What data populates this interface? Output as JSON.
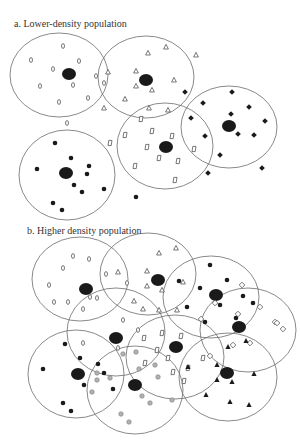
{
  "colors": {
    "circle_stroke": "#6b6b6b",
    "center": "#1a1a1a",
    "filled_marker": "#1a1a1a",
    "grey_marker": "#b0b0b0",
    "outline_marker": "#555555",
    "text": "#333333"
  },
  "panels": [
    {
      "id": "a",
      "label": "a. Lower-density population",
      "circles": [
        {
          "cx": 59,
          "cy": 75,
          "rx": 49,
          "ry": 42
        },
        {
          "cx": 146,
          "cy": 77,
          "rx": 48,
          "ry": 41
        },
        {
          "cx": 229,
          "cy": 127,
          "rx": 48,
          "ry": 41
        },
        {
          "cx": 165,
          "cy": 146,
          "rx": 48,
          "ry": 43
        },
        {
          "cx": 67,
          "cy": 175,
          "rx": 48,
          "ry": 45
        }
      ],
      "centers": [
        {
          "x": 69,
          "y": 74,
          "rx": 7,
          "ry": 6
        },
        {
          "x": 146,
          "y": 80,
          "rx": 7,
          "ry": 6
        },
        {
          "x": 229,
          "y": 126,
          "rx": 7,
          "ry": 6
        },
        {
          "x": 166,
          "y": 147,
          "rx": 7,
          "ry": 6
        },
        {
          "x": 66,
          "y": 173,
          "rx": 7,
          "ry": 6
        }
      ],
      "markers": [
        {
          "shape": "oval",
          "x": 63,
          "y": 46
        },
        {
          "shape": "oval",
          "x": 31,
          "y": 60
        },
        {
          "shape": "oval",
          "x": 79,
          "y": 61
        },
        {
          "shape": "oval",
          "x": 53,
          "y": 69
        },
        {
          "shape": "oval",
          "x": 96,
          "y": 76
        },
        {
          "shape": "oval",
          "x": 40,
          "y": 86
        },
        {
          "shape": "oval",
          "x": 73,
          "y": 85
        },
        {
          "shape": "oval",
          "x": 104,
          "y": 83
        },
        {
          "shape": "oval",
          "x": 88,
          "y": 98
        },
        {
          "shape": "oval",
          "x": 59,
          "y": 102
        },
        {
          "shape": "oval",
          "x": 67,
          "y": 123
        },
        {
          "shape": "triangle",
          "x": 148,
          "y": 53
        },
        {
          "shape": "triangle",
          "x": 166,
          "y": 47
        },
        {
          "shape": "triangle",
          "x": 196,
          "y": 55
        },
        {
          "shape": "triangle",
          "x": 108,
          "y": 72
        },
        {
          "shape": "triangle",
          "x": 136,
          "y": 71
        },
        {
          "shape": "triangle",
          "x": 174,
          "y": 80
        },
        {
          "shape": "triangle",
          "x": 136,
          "y": 86
        },
        {
          "shape": "triangle",
          "x": 152,
          "y": 90
        },
        {
          "shape": "triangle",
          "x": 125,
          "y": 99
        },
        {
          "shape": "triangle",
          "x": 104,
          "y": 108
        },
        {
          "shape": "triangle",
          "x": 149,
          "y": 108
        },
        {
          "shape": "triangle",
          "x": 168,
          "y": 110
        },
        {
          "shape": "diamond",
          "x": 185,
          "y": 92
        },
        {
          "shape": "diamond",
          "x": 232,
          "y": 92
        },
        {
          "shape": "diamond",
          "x": 203,
          "y": 103
        },
        {
          "shape": "diamond",
          "x": 249,
          "y": 107
        },
        {
          "shape": "diamond",
          "x": 231,
          "y": 114
        },
        {
          "shape": "diamond",
          "x": 191,
          "y": 118
        },
        {
          "shape": "diamond",
          "x": 265,
          "y": 121
        },
        {
          "shape": "diamond",
          "x": 205,
          "y": 136
        },
        {
          "shape": "diamond",
          "x": 238,
          "y": 134
        },
        {
          "shape": "diamond",
          "x": 254,
          "y": 135
        },
        {
          "shape": "diamond",
          "x": 220,
          "y": 155
        },
        {
          "shape": "diamond",
          "x": 208,
          "y": 173
        },
        {
          "shape": "diamond",
          "x": 262,
          "y": 168
        },
        {
          "shape": "rect",
          "x": 141,
          "y": 119
        },
        {
          "shape": "rect",
          "x": 110,
          "y": 143
        },
        {
          "shape": "rect",
          "x": 125,
          "y": 135
        },
        {
          "shape": "rect",
          "x": 152,
          "y": 131
        },
        {
          "shape": "rect",
          "x": 172,
          "y": 136
        },
        {
          "shape": "rect",
          "x": 147,
          "y": 147
        },
        {
          "shape": "rect",
          "x": 194,
          "y": 149
        },
        {
          "shape": "rect",
          "x": 159,
          "y": 158
        },
        {
          "shape": "rect",
          "x": 178,
          "y": 161
        },
        {
          "shape": "rect",
          "x": 135,
          "y": 166
        },
        {
          "shape": "rect",
          "x": 175,
          "y": 180
        },
        {
          "shape": "dot",
          "x": 55,
          "y": 143
        },
        {
          "shape": "dot",
          "x": 37,
          "y": 169
        },
        {
          "shape": "dot",
          "x": 71,
          "y": 158
        },
        {
          "shape": "dot",
          "x": 89,
          "y": 166
        },
        {
          "shape": "dot",
          "x": 87,
          "y": 174
        },
        {
          "shape": "dot",
          "x": 74,
          "y": 185
        },
        {
          "shape": "dot",
          "x": 82,
          "y": 192
        },
        {
          "shape": "dot",
          "x": 104,
          "y": 189
        },
        {
          "shape": "dot",
          "x": 53,
          "y": 203
        },
        {
          "shape": "dot",
          "x": 62,
          "y": 210
        },
        {
          "shape": "dot",
          "x": 136,
          "y": 197
        }
      ]
    },
    {
      "id": "b",
      "label": "b. Higher density population",
      "circles": [
        {
          "cx": 80,
          "cy": 279,
          "rx": 48,
          "ry": 42
        },
        {
          "cx": 148,
          "cy": 274,
          "rx": 48,
          "ry": 41
        },
        {
          "cx": 211,
          "cy": 297,
          "rx": 48,
          "ry": 41
        },
        {
          "cx": 248,
          "cy": 330,
          "rx": 48,
          "ry": 42
        },
        {
          "cx": 116,
          "cy": 332,
          "rx": 49,
          "ry": 44
        },
        {
          "cx": 175,
          "cy": 357,
          "rx": 49,
          "ry": 42
        },
        {
          "cx": 76,
          "cy": 374,
          "rx": 48,
          "ry": 44
        },
        {
          "cx": 135,
          "cy": 390,
          "rx": 48,
          "ry": 44
        },
        {
          "cx": 228,
          "cy": 377,
          "rx": 49,
          "ry": 44
        }
      ],
      "centers": [
        {
          "x": 86,
          "y": 289,
          "rx": 7,
          "ry": 6
        },
        {
          "x": 158,
          "y": 280,
          "rx": 7,
          "ry": 6
        },
        {
          "x": 216,
          "y": 295,
          "rx": 7,
          "ry": 6
        },
        {
          "x": 239,
          "y": 327,
          "rx": 7,
          "ry": 6
        },
        {
          "x": 116,
          "y": 338,
          "rx": 7,
          "ry": 6
        },
        {
          "x": 176,
          "y": 347,
          "rx": 7,
          "ry": 6
        },
        {
          "x": 78,
          "y": 374,
          "rx": 7,
          "ry": 6
        },
        {
          "x": 135,
          "y": 385,
          "rx": 7,
          "ry": 6
        },
        {
          "x": 227,
          "y": 373,
          "rx": 7,
          "ry": 6
        }
      ],
      "markers": [
        {
          "shape": "oval",
          "x": 73,
          "y": 256
        },
        {
          "shape": "oval",
          "x": 89,
          "y": 259
        },
        {
          "shape": "oval",
          "x": 63,
          "y": 268
        },
        {
          "shape": "oval",
          "x": 106,
          "y": 274
        },
        {
          "shape": "oval",
          "x": 49,
          "y": 285
        },
        {
          "shape": "oval",
          "x": 127,
          "y": 283
        },
        {
          "shape": "oval",
          "x": 97,
          "y": 298
        },
        {
          "shape": "oval",
          "x": 54,
          "y": 302
        },
        {
          "shape": "oval",
          "x": 68,
          "y": 302
        },
        {
          "shape": "oval",
          "x": 90,
          "y": 297
        },
        {
          "shape": "oval",
          "x": 83,
          "y": 309
        },
        {
          "shape": "oval",
          "x": 123,
          "y": 320
        },
        {
          "shape": "oval",
          "x": 83,
          "y": 343
        },
        {
          "shape": "oval",
          "x": 138,
          "y": 330
        },
        {
          "shape": "oval",
          "x": 118,
          "y": 348
        },
        {
          "shape": "triangle",
          "x": 159,
          "y": 253
        },
        {
          "shape": "triangle",
          "x": 176,
          "y": 248
        },
        {
          "shape": "triangle",
          "x": 118,
          "y": 272
        },
        {
          "shape": "triangle",
          "x": 147,
          "y": 271
        },
        {
          "shape": "triangle",
          "x": 147,
          "y": 286
        },
        {
          "shape": "triangle",
          "x": 162,
          "y": 290
        },
        {
          "shape": "triangle",
          "x": 134,
          "y": 301
        },
        {
          "shape": "triangle",
          "x": 183,
          "y": 282
        },
        {
          "shape": "triangle",
          "x": 177,
          "y": 310
        },
        {
          "shape": "triangle",
          "x": 159,
          "y": 310
        },
        {
          "shape": "triangle",
          "x": 143,
          "y": 309
        },
        {
          "shape": "dot",
          "x": 210,
          "y": 265
        },
        {
          "shape": "dot",
          "x": 179,
          "y": 281
        },
        {
          "shape": "dot",
          "x": 227,
          "y": 280
        },
        {
          "shape": "dot",
          "x": 200,
          "y": 288
        },
        {
          "shape": "dot",
          "x": 220,
          "y": 305
        },
        {
          "shape": "dot",
          "x": 243,
          "y": 296
        },
        {
          "shape": "dot",
          "x": 253,
          "y": 303
        },
        {
          "shape": "dot",
          "x": 187,
          "y": 307
        },
        {
          "shape": "dot",
          "x": 205,
          "y": 322
        },
        {
          "shape": "dot",
          "x": 236,
          "y": 318
        },
        {
          "shape": "dot",
          "x": 65,
          "y": 344
        },
        {
          "shape": "dot",
          "x": 43,
          "y": 369
        },
        {
          "shape": "dot",
          "x": 80,
          "y": 358
        },
        {
          "shape": "dot",
          "x": 98,
          "y": 364
        },
        {
          "shape": "dot",
          "x": 104,
          "y": 373
        },
        {
          "shape": "dot",
          "x": 84,
          "y": 385
        },
        {
          "shape": "dot",
          "x": 113,
          "y": 389
        },
        {
          "shape": "dot",
          "x": 63,
          "y": 403
        },
        {
          "shape": "dot",
          "x": 71,
          "y": 411
        },
        {
          "shape": "diamond",
          "x": 242,
          "y": 285
        },
        {
          "shape": "diamond",
          "x": 215,
          "y": 303
        },
        {
          "shape": "diamond",
          "x": 260,
          "y": 307
        },
        {
          "shape": "diamond",
          "x": 238,
          "y": 314
        },
        {
          "shape": "diamond",
          "x": 201,
          "y": 319
        },
        {
          "shape": "diamond",
          "x": 275,
          "y": 322
        },
        {
          "shape": "diamond",
          "x": 283,
          "y": 329
        },
        {
          "shape": "diamond",
          "x": 233,
          "y": 345
        },
        {
          "shape": "diamond",
          "x": 250,
          "y": 343
        },
        {
          "shape": "diamond",
          "x": 210,
          "y": 356
        },
        {
          "shape": "diamond",
          "x": 277,
          "y": 323
        },
        {
          "shape": "rect",
          "x": 162,
          "y": 333
        },
        {
          "shape": "rect",
          "x": 181,
          "y": 336
        },
        {
          "shape": "rect",
          "x": 144,
          "y": 338
        },
        {
          "shape": "rect",
          "x": 203,
          "y": 358
        },
        {
          "shape": "rect",
          "x": 157,
          "y": 350
        },
        {
          "shape": "rect",
          "x": 168,
          "y": 358
        },
        {
          "shape": "rect",
          "x": 145,
          "y": 363
        },
        {
          "shape": "rect",
          "x": 188,
          "y": 368
        },
        {
          "shape": "rect",
          "x": 184,
          "y": 381
        },
        {
          "shape": "rect",
          "x": 173,
          "y": 372
        },
        {
          "shape": "grey",
          "x": 97,
          "y": 373
        },
        {
          "shape": "grey",
          "x": 123,
          "y": 354
        },
        {
          "shape": "grey",
          "x": 97,
          "y": 380
        },
        {
          "shape": "grey",
          "x": 110,
          "y": 378
        },
        {
          "shape": "grey",
          "x": 139,
          "y": 369
        },
        {
          "shape": "grey",
          "x": 155,
          "y": 365
        },
        {
          "shape": "grey",
          "x": 158,
          "y": 377
        },
        {
          "shape": "grey",
          "x": 92,
          "y": 392
        },
        {
          "shape": "grey",
          "x": 142,
          "y": 396
        },
        {
          "shape": "grey",
          "x": 150,
          "y": 403
        },
        {
          "shape": "grey",
          "x": 172,
          "y": 400
        },
        {
          "shape": "grey",
          "x": 121,
          "y": 414
        },
        {
          "shape": "grey",
          "x": 129,
          "y": 422
        },
        {
          "shape": "grey",
          "x": 136,
          "y": 352
        },
        {
          "shape": "filltri",
          "x": 228,
          "y": 347
        },
        {
          "shape": "filltri",
          "x": 246,
          "y": 341
        },
        {
          "shape": "filltri",
          "x": 188,
          "y": 367
        },
        {
          "shape": "filltri",
          "x": 217,
          "y": 365
        },
        {
          "shape": "filltri",
          "x": 254,
          "y": 374
        },
        {
          "shape": "filltri",
          "x": 217,
          "y": 380
        },
        {
          "shape": "filltri",
          "x": 232,
          "y": 382
        },
        {
          "shape": "filltri",
          "x": 206,
          "y": 395
        },
        {
          "shape": "filltri",
          "x": 230,
          "y": 402
        },
        {
          "shape": "filltri",
          "x": 249,
          "y": 405
        }
      ]
    }
  ]
}
